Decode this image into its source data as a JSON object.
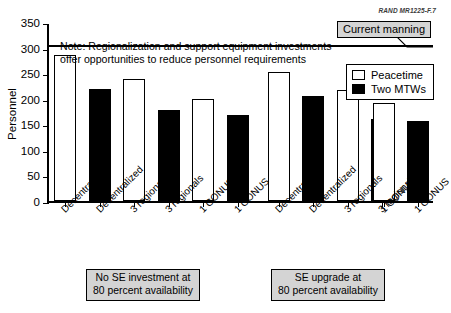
{
  "source_id": "RAND MR1225-F.7",
  "annotations": {
    "callout_label": "Current manning",
    "note_line1": "Note:  Regionalization and support equipment investments",
    "note_line2": "offer opportunities to reduce personnel requirements"
  },
  "legend": {
    "items": [
      {
        "label": "Peacetime",
        "style": "outline",
        "color": "#ffffff"
      },
      {
        "label": "Two MTWs",
        "style": "filled",
        "color": "#000000"
      }
    ]
  },
  "captions": {
    "left_line1": "No SE investment at",
    "left_line2": "80 percent availability",
    "right_line1": "SE upgrade at",
    "right_line2": "80 percent availability"
  },
  "axis": {
    "y_label": "Personnel",
    "y_ticks": [
      0,
      50,
      100,
      150,
      200,
      250,
      300,
      350
    ]
  },
  "chart_data": {
    "type": "bar",
    "title": "",
    "subtitle": "",
    "xlabel": "",
    "ylabel": "Personnel",
    "ylim": [
      0,
      350
    ],
    "ytick_step": 50,
    "grid": false,
    "legend_position": "top-right",
    "categories": [
      "Decentralized",
      "Decentralized",
      "3 regionals",
      "3 regionals",
      "1 CONUS",
      "1 CONUS",
      "Decentralized",
      "Decentralized",
      "3 regionals",
      "3 regionals",
      "1 CONUS",
      "1 CONUS"
    ],
    "bar_series": [
      "Peacetime",
      "Two MTWs",
      "Peacetime",
      "Two MTWs",
      "Peacetime",
      "Two MTWs",
      "Peacetime",
      "Two MTWs",
      "Peacetime",
      "Two MTWs",
      "Peacetime",
      "Two MTWs"
    ],
    "values": [
      285,
      220,
      238,
      178,
      200,
      168,
      253,
      206,
      217,
      161,
      191,
      157
    ],
    "groups": [
      {
        "name": "No SE investment at 80 percent availability",
        "categories": [
          "Decentralized",
          "3 regionals",
          "1 CONUS"
        ],
        "series": [
          {
            "name": "Peacetime",
            "values": [
              285,
              238,
              200
            ]
          },
          {
            "name": "Two MTWs",
            "values": [
              220,
              178,
              168
            ]
          }
        ]
      },
      {
        "name": "SE upgrade at 80 percent availability",
        "categories": [
          "Decentralized",
          "3 regionals",
          "1 CONUS"
        ],
        "series": [
          {
            "name": "Peacetime",
            "values": [
              253,
              217,
              191
            ]
          },
          {
            "name": "Two MTWs",
            "values": [
              206,
              161,
              157
            ]
          }
        ]
      }
    ],
    "reference_lines": [
      {
        "label": "Current manning",
        "value": 308,
        "orientation": "horizontal"
      }
    ],
    "annotations": [
      "Note:  Regionalization and support equipment investments",
      "offer opportunities to reduce personnel requirements"
    ]
  },
  "colors": {
    "peacetime": "#ffffff",
    "two_mtws": "#000000",
    "box_fill": "#d4d4d4",
    "line": "#000000"
  }
}
